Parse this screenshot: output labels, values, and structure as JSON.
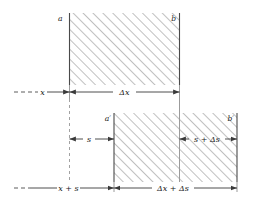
{
  "figure": {
    "background_color": "#ffffff",
    "line_color": "#3a3a3a",
    "hatch_color": "#9a9a9a",
    "label_color": "#1a1a1a",
    "corner_labels": {
      "top_left": "a",
      "top_right": "b",
      "bottom_left": "a′",
      "bottom_right": "b′"
    },
    "dimensions": [
      {
        "id": "x",
        "label": "x",
        "row": "top",
        "style": "dash-dot-open-left"
      },
      {
        "id": "delta-x",
        "label": "Δx",
        "row": "top",
        "style": "double-arrow"
      },
      {
        "id": "s",
        "label": "s",
        "row": "middle",
        "style": "double-arrow"
      },
      {
        "id": "s-delta-s",
        "label": "s + Δs",
        "row": "middle",
        "style": "double-arrow"
      },
      {
        "id": "x-plus-s",
        "label": "x + s",
        "row": "bottom",
        "style": "dash-dot-open-left"
      },
      {
        "id": "delta-x-delta-s",
        "label": "Δx + Δs",
        "row": "bottom",
        "style": "double-arrow"
      }
    ],
    "labels": {
      "x": "x",
      "delta_x": "Δx",
      "s": "s",
      "s_plus_delta_s": "s + Δs",
      "x_plus_s": "x + s",
      "delta_x_plus_delta_s": "Δx + Δs"
    }
  }
}
